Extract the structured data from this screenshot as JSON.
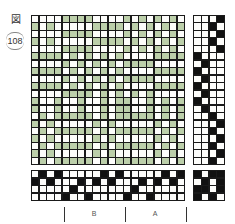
{
  "figure": {
    "label": "図",
    "number": "108"
  },
  "colors": {
    "warp_float": "#bccfaa",
    "weft": "#fdfdfb",
    "filled": "#111111",
    "grid_line": "#1a1a1a"
  },
  "drawdown": {
    "cols": 20,
    "rows": 20,
    "legend": "w = white square, g = green warp float",
    "data": [
      "wwwwggggwwwwgwgwgwgw",
      "gwgwwwwwggggwgwgwgwg",
      "wwwwggggwwwwgwgwgwgw",
      "gwgwwwwwggggwgwgwgwg",
      "wwwwggggwwwwgwgwgwgw",
      "ggggwgwgwgwgwwwwgggg",
      "wwwwgwgwgwgwggggwwww",
      "ggggwgwgwgwgwwwwgggg",
      "wwwwgwgwgwgwggggwwww",
      "ggggwgwgwgwgwwwwgggg",
      "wwwwggggwgwgwgwgwwww",
      "gwwgwwgwwgwggwwgwgwg",
      "gwwgwwgwwgwggwwgwgwg",
      "wgwgggggwgwgggggwgwg",
      "gwgwwwwwgwgwwwwwgwgw",
      "wgwgggggwgwgggggwgwg",
      "gwgwwwwwgwgwwwwwgwgw",
      "wgwgggggwgwgggggwgwg",
      "gwgwwwwwgwgwwwwwgwgw",
      "wgwgggggwgwgggggwgwg"
    ]
  },
  "treadling": {
    "cols": 4,
    "rows": 20,
    "data": [
      "wwwk",
      "wwkw",
      "wwwk",
      "wwkw",
      "wwwk",
      "kwww",
      "wkww",
      "kwww",
      "wkww",
      "kwww",
      "wkww",
      "kwww",
      "wkww",
      "wwkw",
      "wwwk",
      "wwkw",
      "wwwk",
      "wwkw",
      "wwwk",
      "wwkw"
    ]
  },
  "threading": {
    "cols": 20,
    "rows": 4,
    "data": [
      "wkwkwwwwwkwkwwwwwkwk",
      "kwkwwwkwkwkwwwkwkwkw",
      "wwwwwkwwwwwwwkwwwwww",
      "wwwwkwwkwwwwkwwkwwww"
    ]
  },
  "tieup": {
    "cols": 4,
    "rows": 4,
    "data": [
      "kwkk",
      "wkwk",
      "kkwk",
      "kwkw"
    ]
  },
  "sections": [
    {
      "label": "B"
    },
    {
      "label": "A"
    }
  ]
}
